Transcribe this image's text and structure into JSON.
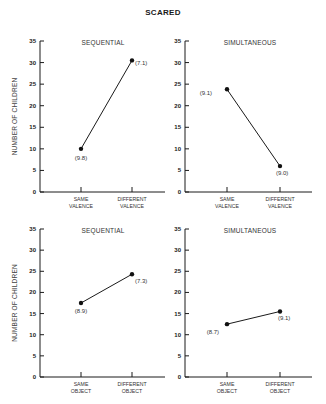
{
  "title": "SCARED",
  "chart_data": [
    {
      "type": "line",
      "title": "SEQUENTIAL",
      "row": "top",
      "ylabel": "NUMBER OF CHILDREN",
      "xlabel": "",
      "categories": [
        "SAME VALENCE",
        "DIFFERENT VALENCE"
      ],
      "values": [
        10,
        30.5
      ],
      "point_labels": [
        "(9.8)",
        "(7.1)"
      ],
      "ylim": [
        0,
        35
      ],
      "yticks": [
        0,
        5,
        10,
        15,
        20,
        25,
        30,
        35
      ],
      "grid": false
    },
    {
      "type": "line",
      "title": "SIMULTANEOUS",
      "row": "top",
      "ylabel": "",
      "xlabel": "",
      "categories": [
        "SAME VALENCE",
        "DIFFERENT VALENCE"
      ],
      "values": [
        23.8,
        6
      ],
      "point_labels": [
        "(9.1)",
        "(9.0)"
      ],
      "ylim": [
        0,
        35
      ],
      "yticks": [
        0,
        5,
        10,
        15,
        20,
        25,
        30,
        35
      ],
      "grid": false
    },
    {
      "type": "line",
      "title": "SEQUENTIAL",
      "row": "bottom",
      "ylabel": "NUMBER OF CHILDREN",
      "xlabel": "",
      "categories": [
        "SAME OBJECT",
        "DIFFERENT OBJECT"
      ],
      "values": [
        17.5,
        24.3
      ],
      "point_labels": [
        "(8.9)",
        "(7.3)"
      ],
      "ylim": [
        0,
        35
      ],
      "yticks": [
        0,
        5,
        10,
        15,
        20,
        25,
        30,
        35
      ],
      "grid": false
    },
    {
      "type": "line",
      "title": "SIMULTANEOUS",
      "row": "bottom",
      "ylabel": "",
      "xlabel": "",
      "categories": [
        "SAME OBJECT",
        "DIFFERENT OBJECT"
      ],
      "values": [
        12.5,
        15.5
      ],
      "point_labels": [
        "(8.7)",
        "(9.1)"
      ],
      "ylim": [
        0,
        35
      ],
      "yticks": [
        0,
        5,
        10,
        15,
        20,
        25,
        30,
        35
      ],
      "grid": false
    }
  ]
}
